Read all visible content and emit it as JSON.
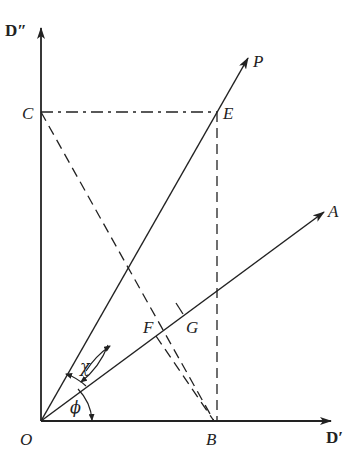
{
  "diagram": {
    "type": "vector-geometry",
    "axes": {
      "horizontal": "D′",
      "vertical": "D″"
    },
    "points": {
      "O": "O",
      "B": "B",
      "C": "C",
      "E": "E",
      "F": "F",
      "G": "G",
      "P": "P",
      "A": "A"
    },
    "angles": {
      "chi": "χ",
      "phi": "ϕ"
    },
    "colors": {
      "ink": "#222222",
      "background": "#ffffff"
    }
  }
}
